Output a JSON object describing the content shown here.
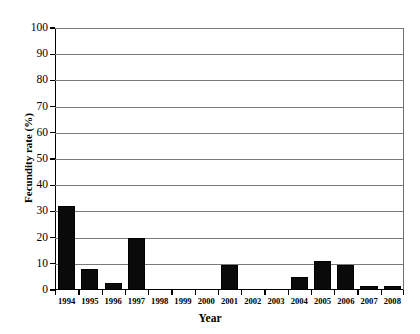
{
  "chart_data": {
    "type": "bar",
    "title": "",
    "xlabel": "Year",
    "ylabel": "Fecundity rate (%)",
    "categories": [
      "1994",
      "1995",
      "1996",
      "1997",
      "1998",
      "1999",
      "2000",
      "2001",
      "2002",
      "2003",
      "2004",
      "2005",
      "2006",
      "2007",
      "2008"
    ],
    "values": [
      32,
      8,
      2.5,
      20,
      0,
      0,
      0,
      9.5,
      0,
      0,
      5,
      11,
      9.5,
      1.5,
      1.5
    ],
    "ylim": [
      0,
      100
    ],
    "y_ticks": [
      0,
      10,
      20,
      30,
      40,
      50,
      60,
      70,
      80,
      90,
      100
    ],
    "y_tick_labels": [
      "0",
      "10",
      "20",
      "30",
      "40",
      "50",
      "60",
      "70",
      "80",
      "90",
      "100"
    ],
    "grid": "horizontal",
    "legend": "none",
    "bar_color": "#0a0a0a",
    "gridline_color": "#7a7a7a",
    "axis_color": "#000000"
  }
}
